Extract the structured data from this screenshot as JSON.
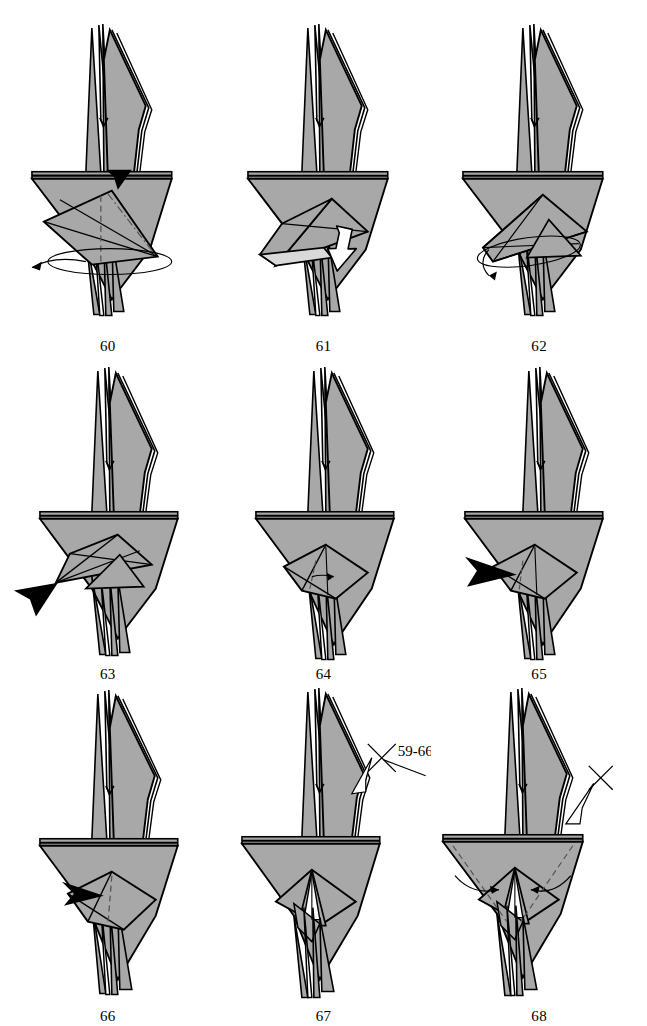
{
  "page": {
    "kind": "origami-instruction-diagram",
    "background_color": "#ffffff",
    "ink_color": "#000000",
    "paper_front_color": "#a8a8a8",
    "paper_back_color": "#d9d9d9",
    "paper_shadow_color": "#8e8e8e",
    "columns": 3,
    "rows": 3
  },
  "steps": [
    {
      "number": "60",
      "caption": "60",
      "annotations": [
        {
          "type": "push-in-arrowhead",
          "color": "#000000",
          "position": "top-center-of-lower-flap"
        },
        {
          "type": "rotate-ellipse",
          "color": "#000000",
          "position": "around-lower-body"
        },
        {
          "type": "rotate-arrow",
          "direction": "left",
          "color": "#000000"
        },
        {
          "type": "valley-fold-dashed",
          "color": "#555555"
        },
        {
          "type": "mountain-fold-dashdot",
          "color": "#555555"
        }
      ]
    },
    {
      "number": "61",
      "caption": "61",
      "annotations": [
        {
          "type": "hollow-white-arrow",
          "direction": "down-right",
          "color": "#ffffff",
          "outline": "#000000"
        },
        {
          "type": "light-flap",
          "color": "#d9d9d9"
        }
      ]
    },
    {
      "number": "62",
      "caption": "62",
      "annotations": [
        {
          "type": "rotate-ellipse",
          "color": "#000000"
        },
        {
          "type": "rotate-arrow",
          "direction": "down-left",
          "color": "#000000"
        }
      ]
    },
    {
      "number": "63",
      "caption": "63",
      "annotations": [
        {
          "type": "push-in-arrowhead",
          "color": "#000000",
          "position": "left-outside"
        }
      ]
    },
    {
      "number": "64",
      "caption": "64",
      "annotations": [
        {
          "type": "valley-fold-dashed",
          "color": "#555555"
        },
        {
          "type": "small-fold-arrow",
          "color": "#000000"
        }
      ]
    },
    {
      "number": "65",
      "caption": "65",
      "annotations": [
        {
          "type": "push-in-arrowhead",
          "direction": "right",
          "color": "#000000",
          "position": "left-edge"
        },
        {
          "type": "valley-fold-dashed",
          "color": "#555555"
        }
      ]
    },
    {
      "number": "66",
      "caption": "66",
      "annotations": [
        {
          "type": "push-in-arrowhead",
          "direction": "right",
          "color": "#000000",
          "position": "left-of-center"
        },
        {
          "type": "valley-fold-dashed",
          "color": "#555555"
        }
      ]
    },
    {
      "number": "67",
      "caption": "67",
      "label": "59-66",
      "annotations": [
        {
          "type": "repeat-cross",
          "label": "59-66",
          "color": "#000000"
        },
        {
          "type": "hollow-pointer-arrow",
          "direction": "down-left",
          "outline": "#000000"
        }
      ]
    },
    {
      "number": "68",
      "caption": "68",
      "label": "",
      "annotations": [
        {
          "type": "repeat-cross",
          "label": "",
          "color": "#000000"
        },
        {
          "type": "hollow-pointer-arrow",
          "direction": "down-left",
          "outline": "#000000"
        },
        {
          "type": "fold-arrow-curved",
          "direction": "inward-left",
          "color": "#000000"
        },
        {
          "type": "fold-arrow-curved",
          "direction": "inward-right",
          "color": "#000000"
        },
        {
          "type": "valley-fold-dashed",
          "color": "#555555"
        }
      ]
    }
  ]
}
